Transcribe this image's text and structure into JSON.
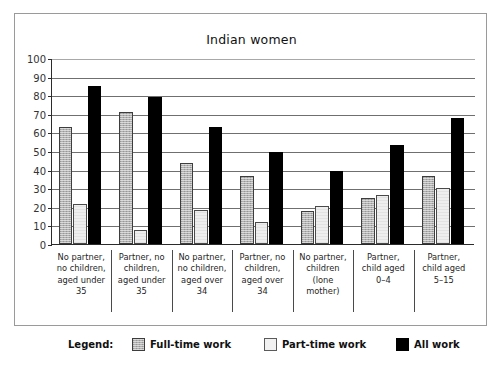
{
  "chart_data": {
    "type": "bar",
    "title": "Indian women",
    "xlabel": "",
    "ylabel": "",
    "ylim": [
      0,
      100
    ],
    "yticks": [
      0,
      10,
      20,
      30,
      40,
      50,
      60,
      70,
      80,
      90,
      100
    ],
    "grid": true,
    "legend_position": "bottom",
    "categories": [
      "No partner, no children, aged under 35",
      "Partner, no children, aged under 35",
      "No partner, no children, aged over 34",
      "Partner, no children, aged over 34",
      "No partner, children (lone mother)",
      "Partner, child aged 0–4",
      "Partner, child aged 5–15"
    ],
    "category_lines": [
      [
        "No partner,",
        "no children,",
        "aged under",
        "35"
      ],
      [
        "Partner, no",
        "children,",
        "aged under",
        "35"
      ],
      [
        "No partner,",
        "no children,",
        "aged over",
        "34"
      ],
      [
        "Partner, no",
        "children,",
        "aged over",
        "34"
      ],
      [
        "No partner,",
        "children",
        "(lone",
        "mother)"
      ],
      [
        "Partner,",
        "child aged",
        "0–4",
        ""
      ],
      [
        "Partner,",
        "child aged",
        "5–15",
        ""
      ]
    ],
    "series": [
      {
        "name": "Full-time work",
        "color": "#b0b0b0",
        "values": [
          63,
          71,
          43.5,
          36.5,
          18,
          25,
          36.5
        ]
      },
      {
        "name": "Part-time work",
        "color": "#eeeeee",
        "values": [
          21.5,
          7.5,
          18.5,
          12,
          20.5,
          26.5,
          30
        ]
      },
      {
        "name": "All work",
        "color": "#000000",
        "values": [
          85,
          79,
          63,
          49.5,
          39.5,
          53,
          67.5
        ]
      }
    ]
  },
  "legend": {
    "title": "Legend:",
    "entries": [
      {
        "label": "Full-time work"
      },
      {
        "label": "Part-time work"
      },
      {
        "label": "All work"
      }
    ]
  }
}
